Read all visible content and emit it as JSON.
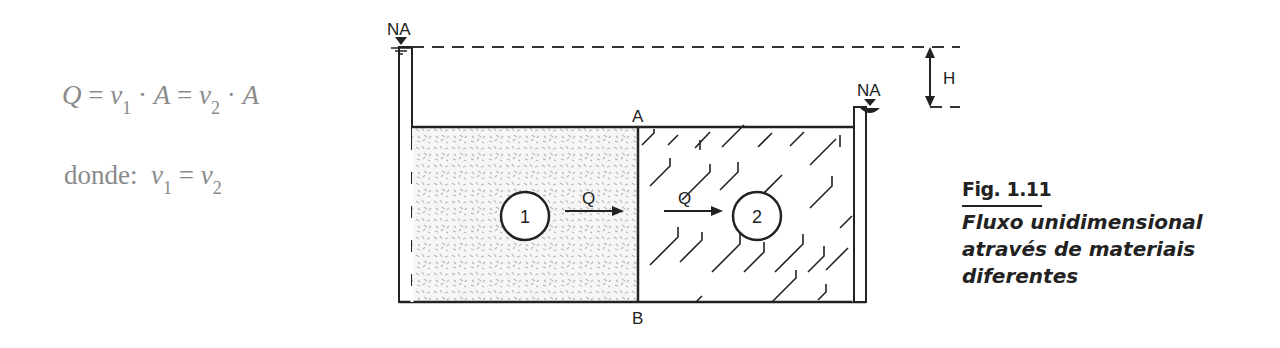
{
  "formula": {
    "line1": {
      "Q": "Q",
      "eq": " = ",
      "v1": "v",
      "sub1": "1",
      "dot1": " · ",
      "A1": "A",
      "eq2": " = ",
      "v2": "v",
      "sub2": "2",
      "dot2": " · ",
      "A2": "A"
    },
    "line2": {
      "prefix": "donde:",
      "v1": "v",
      "sub1": "1",
      "eq": " = ",
      "v2": "v",
      "sub2": "2"
    }
  },
  "diagram": {
    "labels": {
      "na_left": "NA",
      "na_right": "NA",
      "head": "H",
      "point_a": "A",
      "point_b": "B",
      "flow_1": "Q",
      "flow_2": "Q",
      "material_1": "1",
      "material_2": "2"
    },
    "colors": {
      "line": "#222222",
      "speckle": "#bdbdbd"
    }
  },
  "caption": {
    "figure_label": "Fig. 1.11",
    "text_line1": "Fluxo unidimensional",
    "text_line2": "através de materiais",
    "text_line3": "diferentes"
  }
}
